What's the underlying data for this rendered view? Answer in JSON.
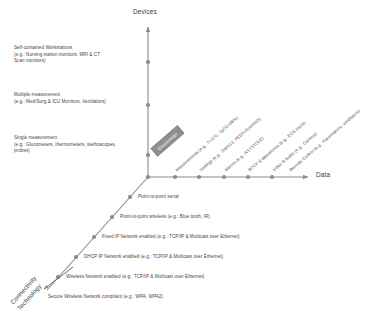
{
  "figure": {
    "axes": {
      "vertical": {
        "title": "Devices",
        "name": "devices-axis"
      },
      "horizontal": {
        "title": "Data",
        "name": "data-axis"
      },
      "diagonal": {
        "title": "Connectivity\nTechnology",
        "name": "connectivity-technology-axis"
      }
    },
    "devices_levels": [
      {
        "label": "Self-contained Workstations\n(e.g.: Nursing station monitors, MRI & CT\nScan monitors)"
      },
      {
        "label": "Multiple measurement\n(e.g.: Med/Surg & ICU Monitors, Ventilators)"
      },
      {
        "label": "Single measurement\n(e.g.: Glucometers, thermometers, stethoscopes,\nprobes)"
      }
    ],
    "data_levels": [
      {
        "label": "Measurements (e.g.: T=37C, SpO2=98%)"
      },
      {
        "label": "Settings (e.g.: SIMV12, PEEP=5cmH2O)"
      },
      {
        "label": "Alarms (e.g.: ASYSTOLE)"
      },
      {
        "label": "RTCP & Waveforms (e.g.: ECG trace)"
      },
      {
        "label": "Video & Audio (e.g.: Camera)"
      },
      {
        "label": "Remote Control (e.g.: Pacemakers, ventilators)"
      }
    ],
    "connectivity_levels": [
      {
        "label": "Point-to-point serial"
      },
      {
        "label": "Point-to-point wireless (e.g.: Blue tooth, IR)"
      },
      {
        "label": "Fixed IP Network enabled (e.g.: TCP/IP & Multicast over Ethernet)"
      },
      {
        "label": "DHCP IP Network enabled (e.g.: TCP/IP & Multicast over Ethernet)"
      },
      {
        "label": "Wireless Network enabled (e.g.: TCP/IP & Multicast over Ethernet)"
      },
      {
        "label": "Secure Wireless Network compliant (e.g.: WPA, WPA2)"
      }
    ],
    "callout": {
      "label": "Glucometer"
    },
    "colors": {
      "axis": "#8a8a8a",
      "dot": "#8a8a8a",
      "callout_fill": "#8e8e8e",
      "text": "#454545"
    }
  }
}
